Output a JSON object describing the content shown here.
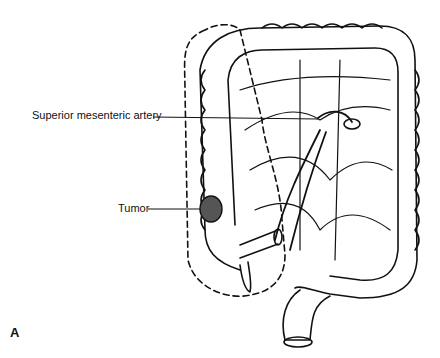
{
  "figure": {
    "panel_label": "A",
    "labels": {
      "artery": "Superior mesenteric artery",
      "tumor": "Tumor"
    }
  },
  "colors": {
    "ink": "#111111",
    "tumor_fill": "#555555",
    "background": "#ffffff"
  }
}
